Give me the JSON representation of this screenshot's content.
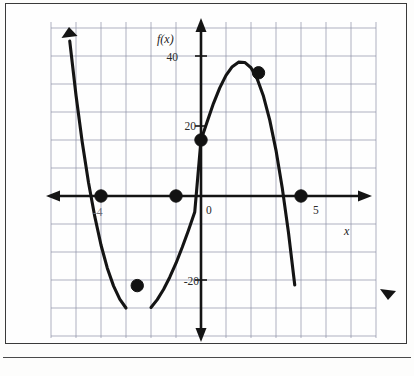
{
  "figure": {
    "frame_color": "#3a3a3a",
    "background_color": "#fefefe",
    "curve_color": "#141414",
    "grid_color": "#8e8fa6",
    "axis_color": "#141414"
  },
  "labels": {
    "y_axis_name": "f(x)",
    "x_axis_name": "x",
    "origin": "0",
    "x_tick_5": "5",
    "x_tick_neg4": "-4",
    "y_tick_40": "40",
    "y_tick_20": "20",
    "y_tick_neg20": "-20"
  },
  "chart_data": {
    "type": "line",
    "title": "",
    "xlabel": "x",
    "ylabel": "f(x)",
    "xlim": [
      -6,
      7
    ],
    "ylim": [
      -50,
      55
    ],
    "grid": true,
    "grid_x_step": 1,
    "grid_y_step": 10,
    "legend_position": "none",
    "x_tick_labels": [
      "-4",
      "0",
      "5"
    ],
    "x_tick_values": [
      -4,
      0,
      5
    ],
    "y_tick_labels": [
      "40",
      "20",
      "-20"
    ],
    "y_tick_values": [
      40,
      20,
      -20
    ],
    "function_expression": "f(x) = -1.25(x+4)(x+1)(x-4)",
    "series": [
      {
        "name": "f(x)",
        "x": [
          -5.25,
          -5.0,
          -4.75,
          -4.5,
          -4.25,
          -4.0,
          -3.75,
          -3.5,
          -3.25,
          -3.0,
          -2.75,
          -2.5,
          -2.25,
          -2.0,
          -1.75,
          -1.5,
          -1.25,
          -1.0,
          -0.75,
          -0.5,
          -0.25,
          0.0,
          0.25,
          0.5,
          0.75,
          1.0,
          1.25,
          1.5,
          1.75,
          2.0,
          2.25,
          2.5,
          2.75,
          3.0,
          3.25,
          3.5,
          3.75,
          4.0,
          4.25,
          4.5,
          4.75
        ],
        "y": [
          55.3,
          36.0,
          19.2,
          4.8,
          -7.3,
          -17.5,
          -25.7,
          -32.1,
          -36.8,
          -40.0,
          -41.8,
          -42.2,
          -41.5,
          -39.8,
          -37.0,
          -33.4,
          -29.0,
          -24.0,
          -18.3,
          -12.2,
          -5.7,
          20.0,
          26.6,
          33.1,
          38.6,
          43.1,
          46.2,
          47.8,
          47.7,
          45.8,
          41.8,
          35.6,
          27.1,
          16.3,
          2.9,
          -13.1,
          -31.8,
          -53.5,
          -78.2,
          -106.1,
          -137.4
        ]
      }
    ],
    "marked_points": [
      {
        "label": "x-intercept-left",
        "x": -4,
        "y": 0
      },
      {
        "label": "local-minimum",
        "x": -2.55,
        "y": -32
      },
      {
        "label": "x-intercept-middle",
        "x": -1,
        "y": 0
      },
      {
        "label": "y-intercept",
        "x": 0,
        "y": 20
      },
      {
        "label": "local-maximum",
        "x": 2.3,
        "y": 44
      },
      {
        "label": "x-intercept-right",
        "x": 4,
        "y": 0
      }
    ],
    "annotations": []
  }
}
